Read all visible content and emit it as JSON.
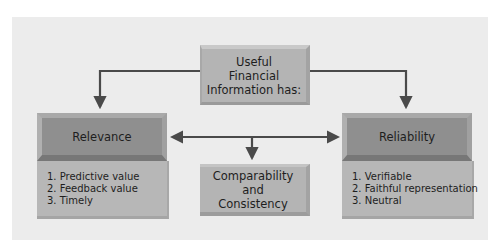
{
  "diagram": {
    "root": {
      "lines": [
        "Useful",
        "Financial",
        "Information has:"
      ]
    },
    "relevance": {
      "title": "Relevance",
      "items": [
        "1. Predictive value",
        "2. Feedback value",
        "3. Timely"
      ]
    },
    "reliability": {
      "title": "Reliability",
      "items": [
        "1. Verifiable",
        "2. Faithful representation",
        "3. Neutral"
      ]
    },
    "comparability": {
      "lines": [
        "Comparability",
        "and",
        "Consistency"
      ]
    },
    "colors": {
      "panel": "#ececec",
      "box": "#b4b4b4",
      "header": "#8f8f8f",
      "arrow": "#4a4a4a"
    }
  }
}
